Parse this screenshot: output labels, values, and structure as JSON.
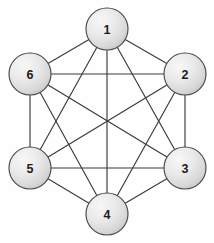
{
  "diagram": {
    "type": "graph",
    "background_color": "#fefefe",
    "canvas": {
      "width": 214,
      "height": 243
    }
  },
  "style": {
    "edge_color": "#3a3a3a",
    "edge_width": 1.15,
    "node_stroke_color": "#4a4a4a",
    "node_stroke_width": 1.15,
    "node_fill_light": "#f4f4f4",
    "node_fill_mid": "#e2e2e2",
    "node_fill_dark": "#c9c9c9",
    "node_label_color": "#1c1c1c",
    "node_radius": 21
  },
  "nodes": [
    {
      "id": "1",
      "label": "1",
      "cx": 107,
      "cy": 29,
      "r": 21
    },
    {
      "id": "2",
      "label": "2",
      "cx": 185,
      "cy": 74,
      "r": 21
    },
    {
      "id": "3",
      "label": "3",
      "cx": 185,
      "cy": 168,
      "r": 21
    },
    {
      "id": "4",
      "label": "4",
      "cx": 107,
      "cy": 214,
      "r": 21
    },
    {
      "id": "5",
      "label": "5",
      "cx": 30,
      "cy": 168,
      "r": 21
    },
    {
      "id": "6",
      "label": "6",
      "cx": 30,
      "cy": 74,
      "r": 21
    }
  ],
  "edges": [
    {
      "from": "1",
      "to": "2"
    },
    {
      "from": "1",
      "to": "3"
    },
    {
      "from": "1",
      "to": "4"
    },
    {
      "from": "1",
      "to": "5"
    },
    {
      "from": "1",
      "to": "6"
    },
    {
      "from": "2",
      "to": "3"
    },
    {
      "from": "2",
      "to": "4"
    },
    {
      "from": "2",
      "to": "5"
    },
    {
      "from": "2",
      "to": "6"
    },
    {
      "from": "3",
      "to": "4"
    },
    {
      "from": "3",
      "to": "5"
    },
    {
      "from": "3",
      "to": "6"
    },
    {
      "from": "4",
      "to": "5"
    },
    {
      "from": "4",
      "to": "6"
    },
    {
      "from": "5",
      "to": "6"
    }
  ]
}
